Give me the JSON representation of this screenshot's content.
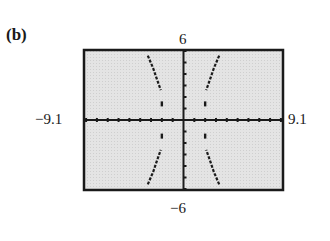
{
  "part_label": "(b)",
  "window": {
    "xmin_label": "−9.1",
    "xmax_label": "9.1",
    "ymin_label": "−6",
    "ymax_label": "6"
  },
  "chart_data": {
    "type": "line",
    "title": "(b)",
    "subtitle": "Graphing calculator screen",
    "xlabel": "",
    "ylabel": "",
    "xlim": [
      -9.1,
      9.1
    ],
    "ylim": [
      -6,
      6
    ],
    "x_ticks": "xscl = 1 (tick marks every unit)",
    "y_ticks": "yscl = 1 (tick marks every unit)",
    "grid": false,
    "legend": null,
    "series": [
      {
        "name": "upper-left branch",
        "x": [
          -3.3,
          -2.8,
          -2.4,
          -2.1,
          -2.0
        ],
        "y": [
          5.6,
          4.5,
          3.4,
          2.6,
          1.4
        ]
      },
      {
        "name": "upper-right branch",
        "x": [
          3.3,
          2.8,
          2.4,
          2.1,
          2.0
        ],
        "y": [
          5.6,
          4.5,
          3.4,
          2.6,
          1.4
        ]
      },
      {
        "name": "lower-left branch",
        "x": [
          -3.3,
          -2.8,
          -2.4,
          -2.1,
          -2.0
        ],
        "y": [
          -5.6,
          -4.5,
          -3.4,
          -2.6,
          -1.4
        ]
      },
      {
        "name": "lower-right branch",
        "x": [
          3.3,
          2.8,
          2.4,
          2.1,
          2.0
        ],
        "y": [
          -5.6,
          -4.5,
          -3.4,
          -2.6,
          -1.4
        ]
      }
    ],
    "colors": {
      "screen": "#e6e6e6",
      "frame": "#1a1a1a",
      "curve": "#1a1a1a"
    }
  }
}
